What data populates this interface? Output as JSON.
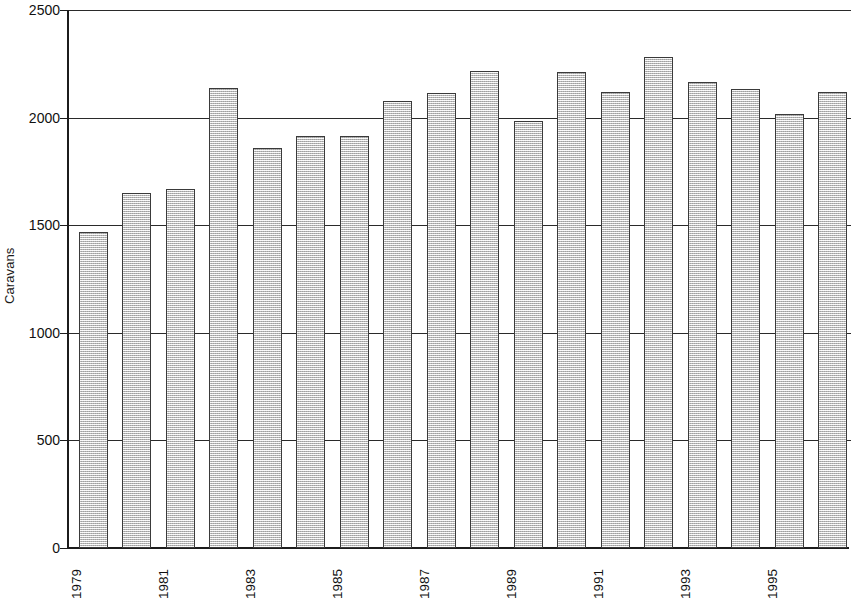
{
  "chart_data": {
    "type": "bar",
    "title": "",
    "subtitle": "",
    "xlabel": "",
    "ylabel": "Caravans",
    "ylim": [
      0,
      2500
    ],
    "y_ticks": [
      0,
      500,
      1000,
      1500,
      2000,
      2500
    ],
    "y_tick_labels": [
      "0",
      "500",
      "1000",
      "1500",
      "2000",
      "2500"
    ],
    "grid": "horizontal",
    "legend": "none",
    "bar_fill_color": "#d6d6d6",
    "bar_border_color": "#3a3a3a",
    "axis_color": "#1c1c1c",
    "note": "Right edge of plot is cropped; final bar is partially visible.",
    "categories": [
      "1979",
      "1980",
      "1981",
      "1982",
      "1983",
      "1984",
      "1985",
      "1986",
      "1987",
      "1988",
      "1989",
      "1990",
      "1991",
      "1992",
      "1993",
      "1994",
      "1995",
      "1996"
    ],
    "x_tick_labels": [
      "1979",
      "1981",
      "1983",
      "1985",
      "1987",
      "1989",
      "1991",
      "1993",
      "1995"
    ],
    "values": [
      1468,
      1650,
      1668,
      2137,
      1858,
      1915,
      1915,
      2077,
      2114,
      2216,
      1985,
      2213,
      2117,
      2280,
      2165,
      2133,
      2015,
      2118
    ],
    "series": [
      {
        "name": "Caravans",
        "values": [
          1468,
          1650,
          1668,
          2137,
          1858,
          1915,
          1915,
          2077,
          2114,
          2216,
          1985,
          2213,
          2117,
          2280,
          2165,
          2133,
          2015,
          2118
        ]
      }
    ]
  }
}
